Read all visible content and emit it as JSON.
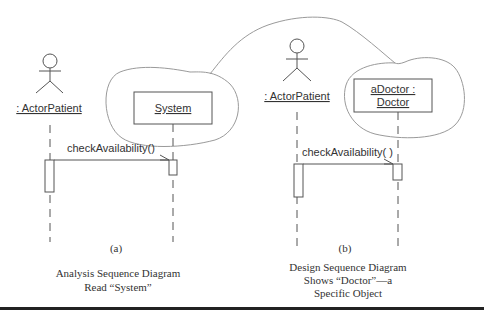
{
  "diagram_a": {
    "actor_label": ": ActorPatient",
    "object_label": "System",
    "message_label": "checkAvailability()",
    "panel_tag": "(a)",
    "caption_line1": "Analysis Sequence Diagram",
    "caption_line2": "Read “System”"
  },
  "diagram_b": {
    "actor_label": ": ActorPatient",
    "object_label_line1": "aDoctor :",
    "object_label_line2": "Doctor",
    "message_label": "checkAvailability( )",
    "panel_tag": "(b)",
    "caption_line1": "Design Sequence Diagram",
    "caption_line2": "Shows “Doctor”—a",
    "caption_line3": "Specific Object"
  },
  "colors": {
    "line": "#555555",
    "cloud": "#9a9a9a",
    "bottom_rule": "#222222"
  }
}
